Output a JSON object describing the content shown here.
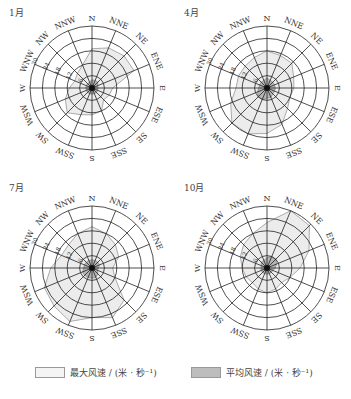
{
  "panels": [
    {
      "month": "1月",
      "cx": 92,
      "cy": 88
    },
    {
      "month": "4月",
      "cx": 92,
      "cy": 88
    },
    {
      "month": "7月",
      "cx": 92,
      "cy": 93
    },
    {
      "month": "10月",
      "cx": 92,
      "cy": 93
    }
  ],
  "directions": [
    "N",
    "NNE",
    "NE",
    "ENE",
    "E",
    "ESE",
    "SE",
    "SSE",
    "S",
    "SSW",
    "SW",
    "WSW",
    "W",
    "WNW",
    "NW",
    "NNW"
  ],
  "rings": [
    "6",
    "12",
    "18",
    "24",
    "30"
  ],
  "legend": {
    "max_label": "最大风速 / (米 · 秒⁻¹)",
    "avg_label": "平均风速 / (米 · 秒⁻¹)",
    "max_color": "#f2f2f2",
    "avg_color": "#bdbdbd"
  },
  "chart_data": [
    {
      "type": "radar",
      "title": "1月",
      "categories": [
        "N",
        "NNE",
        "NE",
        "ENE",
        "E",
        "ESE",
        "SE",
        "SSE",
        "S",
        "SSW",
        "SW",
        "WSW",
        "W",
        "WNW",
        "NW",
        "NNW"
      ],
      "rlim": [
        0,
        30
      ],
      "rticks": [
        6,
        12,
        18,
        24,
        30
      ],
      "series": [
        {
          "name": "最大风速",
          "values": [
            19,
            21,
            22,
            22,
            10,
            9,
            8,
            12,
            13,
            14,
            17,
            14,
            11,
            9,
            10,
            12
          ]
        },
        {
          "name": "平均风速",
          "values": [
            4,
            4,
            4,
            3,
            3,
            3,
            3,
            3,
            3,
            3,
            3,
            3,
            3,
            3,
            3,
            3
          ]
        }
      ]
    },
    {
      "type": "radar",
      "title": "4月",
      "categories": [
        "N",
        "NNE",
        "NE",
        "ENE",
        "E",
        "ESE",
        "SE",
        "SSE",
        "S",
        "SSW",
        "SW",
        "WSW",
        "W",
        "WNW",
        "NW",
        "NNW"
      ],
      "rlim": [
        0,
        30
      ],
      "rticks": [
        6,
        12,
        18,
        24,
        30
      ],
      "series": [
        {
          "name": "最大风速",
          "values": [
            18,
            17,
            17,
            14,
            13,
            12,
            14,
            19,
            22,
            24,
            24,
            19,
            15,
            15,
            15,
            16
          ]
        },
        {
          "name": "平均风速",
          "values": [
            5,
            4,
            4,
            4,
            4,
            4,
            4,
            5,
            5,
            6,
            6,
            5,
            4,
            4,
            4,
            4
          ]
        }
      ]
    },
    {
      "type": "radar",
      "title": "7月",
      "categories": [
        "N",
        "NNE",
        "NE",
        "ENE",
        "E",
        "ESE",
        "SE",
        "SSE",
        "S",
        "SSW",
        "SW",
        "WSW",
        "W",
        "WNW",
        "NW",
        "NNW"
      ],
      "rlim": [
        0,
        30
      ],
      "rticks": [
        6,
        12,
        18,
        24,
        30
      ],
      "series": [
        {
          "name": "最大风速",
          "values": [
            20,
            18,
            16,
            14,
            10,
            12,
            22,
            26,
            24,
            28,
            26,
            25,
            20,
            16,
            16,
            18
          ]
        },
        {
          "name": "平均风速",
          "values": [
            4,
            4,
            4,
            4,
            3,
            3,
            4,
            5,
            5,
            5,
            5,
            5,
            4,
            4,
            4,
            4
          ]
        }
      ]
    },
    {
      "type": "radar",
      "title": "10月",
      "categories": [
        "N",
        "NNE",
        "NE",
        "ENE",
        "E",
        "ESE",
        "SE",
        "SSE",
        "S",
        "SSW",
        "SW",
        "WSW",
        "W",
        "WNW",
        "NW",
        "NNW"
      ],
      "rlim": [
        0,
        30
      ],
      "rticks": [
        6,
        12,
        18,
        24,
        30
      ],
      "series": [
        {
          "name": "最大风速",
          "values": [
            22,
            30,
            29,
            22,
            16,
            12,
            10,
            11,
            12,
            11,
            10,
            11,
            12,
            14,
            16,
            18
          ]
        },
        {
          "name": "平均风速",
          "values": [
            5,
            6,
            6,
            5,
            4,
            3,
            3,
            3,
            3,
            3,
            3,
            3,
            3,
            3,
            4,
            4
          ]
        }
      ]
    }
  ]
}
